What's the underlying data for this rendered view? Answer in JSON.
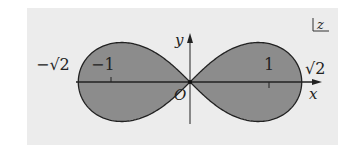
{
  "figure": {
    "plane_label": "z",
    "axes": {
      "x_label": "x",
      "y_label": "y",
      "origin_label": "O"
    },
    "ticks": [
      {
        "label": "−√2",
        "value": -1.4142
      },
      {
        "label": "−1",
        "value": -1
      },
      {
        "label": "1",
        "value": 1
      },
      {
        "label": "√2",
        "value": 1.4142
      }
    ],
    "colors": {
      "background": "#ececec",
      "fill": "#8c8c8c",
      "stroke": "#222222"
    }
  },
  "chart_data": {
    "type": "diagram",
    "curve": "lemniscate of Bernoulli (x^2+y^2)^2 = 2(x^2-y^2), region shaded",
    "x_intercepts": [
      -1.4142,
      0,
      1.4142
    ],
    "ticks_x": [
      "−√2",
      "−1",
      "1",
      "√2"
    ],
    "xlabel": "x",
    "ylabel": "y",
    "annotations": [
      "O",
      "z"
    ]
  }
}
